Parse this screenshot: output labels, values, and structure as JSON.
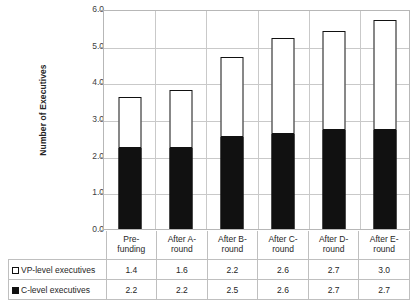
{
  "chart_data": {
    "type": "bar",
    "stacked": true,
    "title": "",
    "xlabel": "",
    "ylabel": "Number of Executives",
    "ylim": [
      0.0,
      6.0
    ],
    "ytick_labels": [
      "6.0",
      "5.0",
      "4.0",
      "3.0",
      "2.0",
      "1.0",
      "0.0"
    ],
    "ytick_values": [
      6.0,
      5.0,
      4.0,
      3.0,
      2.0,
      1.0,
      0.0
    ],
    "grid": true,
    "legend_position": "table-left",
    "categories": [
      "Pre-funding",
      "After A-round",
      "After B-round",
      "After C-round",
      "After D-round",
      "After E-round"
    ],
    "category_lines": [
      [
        "Pre-",
        "funding"
      ],
      [
        "After A-",
        "round"
      ],
      [
        "After B-",
        "round"
      ],
      [
        "After C-",
        "round"
      ],
      [
        "After D-",
        "round"
      ],
      [
        "After E-",
        "round"
      ]
    ],
    "series": [
      {
        "name": "VP-level executives",
        "color": "#ffffff",
        "border_color": "#111111",
        "values": [
          1.4,
          1.6,
          2.2,
          2.6,
          2.7,
          3.0
        ]
      },
      {
        "name": "C-level executives",
        "color": "#111111",
        "border_color": "#111111",
        "values": [
          2.2,
          2.2,
          2.5,
          2.6,
          2.7,
          2.7
        ]
      }
    ],
    "totals": [
      3.6,
      3.8,
      4.7,
      5.2,
      5.4,
      5.7
    ]
  },
  "colors": {
    "gridline": "#c9c9c9",
    "plot_border": "#b7b7b7",
    "table_border": "#bfbfbf",
    "text": "#262626"
  }
}
